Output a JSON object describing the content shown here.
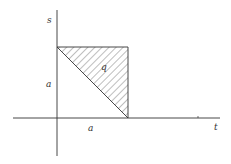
{
  "diagram": {
    "axes": {
      "x_label": "t",
      "y_label": "s"
    },
    "labels": {
      "x_tick": "a",
      "y_tick": "a",
      "region": "q"
    },
    "colors": {
      "line": "#333333",
      "hatch": "#444444",
      "background": "#ffffff"
    }
  }
}
